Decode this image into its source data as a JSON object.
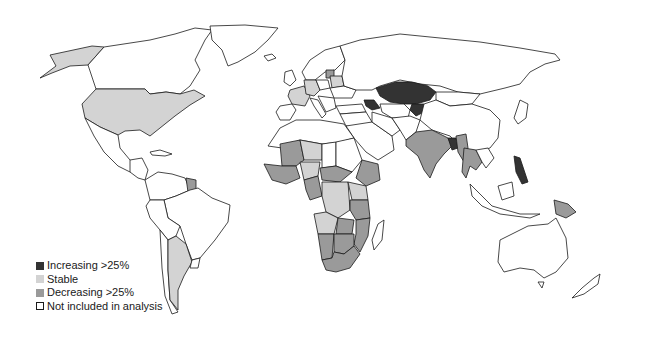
{
  "title": "",
  "categories": {
    "increasing": {
      "label": "Increasing >25%",
      "color": "#333333"
    },
    "stable": {
      "label": "Stable",
      "color": "#d3d3d3"
    },
    "decreasing": {
      "label": "Decreasing >25%",
      "color": "#9a9a9a"
    },
    "not_included": {
      "label": "Not included in analysis",
      "color": "#ffffff"
    }
  },
  "legend": [
    {
      "key": "increasing",
      "label": "Increasing >25%",
      "color": "#333333"
    },
    {
      "key": "stable",
      "label": "Stable",
      "color": "#d3d3d3"
    },
    {
      "key": "decreasing",
      "label": "Decreasing >25%",
      "color": "#9a9a9a"
    },
    {
      "key": "not_included",
      "label": "Not included in analysis",
      "color": "#ffffff"
    }
  ],
  "regions": [
    {
      "name": "Alaska",
      "category": "stable"
    },
    {
      "name": "Canada",
      "category": "not_included"
    },
    {
      "name": "Greenland",
      "category": "not_included"
    },
    {
      "name": "United States",
      "category": "stable"
    },
    {
      "name": "Mexico",
      "category": "not_included"
    },
    {
      "name": "Central America",
      "category": "not_included"
    },
    {
      "name": "Cuba",
      "category": "not_included"
    },
    {
      "name": "Venezuela",
      "category": "not_included"
    },
    {
      "name": "Colombia",
      "category": "not_included"
    },
    {
      "name": "Guyana",
      "category": "decreasing"
    },
    {
      "name": "Brazil",
      "category": "not_included"
    },
    {
      "name": "Peru",
      "category": "not_included"
    },
    {
      "name": "Bolivia",
      "category": "not_included"
    },
    {
      "name": "Chile",
      "category": "not_included"
    },
    {
      "name": "Argentina",
      "category": "stable"
    },
    {
      "name": "Uruguay",
      "category": "not_included"
    },
    {
      "name": "Iceland",
      "category": "not_included"
    },
    {
      "name": "United Kingdom",
      "category": "not_included"
    },
    {
      "name": "Scandinavia",
      "category": "not_included"
    },
    {
      "name": "France",
      "category": "stable"
    },
    {
      "name": "Germany",
      "category": "stable"
    },
    {
      "name": "Iberia",
      "category": "not_included"
    },
    {
      "name": "Italy",
      "category": "not_included"
    },
    {
      "name": "Poland",
      "category": "not_included"
    },
    {
      "name": "Belarus",
      "category": "stable"
    },
    {
      "name": "Baltics",
      "category": "decreasing"
    },
    {
      "name": "Ukraine",
      "category": "not_included"
    },
    {
      "name": "Balkans",
      "category": "not_included"
    },
    {
      "name": "Turkey",
      "category": "not_included"
    },
    {
      "name": "Russia",
      "category": "not_included"
    },
    {
      "name": "Kazakhstan",
      "category": "increasing"
    },
    {
      "name": "Caucasus",
      "category": "increasing"
    },
    {
      "name": "Kyrgyzstan",
      "category": "increasing"
    },
    {
      "name": "Central Asia",
      "category": "not_included"
    },
    {
      "name": "Mongolia",
      "category": "not_included"
    },
    {
      "name": "China",
      "category": "not_included"
    },
    {
      "name": "Japan",
      "category": "not_included"
    },
    {
      "name": "Middle East",
      "category": "not_included"
    },
    {
      "name": "Saudi Arabia",
      "category": "not_included"
    },
    {
      "name": "Iran",
      "category": "not_included"
    },
    {
      "name": "Afghanistan/Pakistan",
      "category": "not_included"
    },
    {
      "name": "India",
      "category": "decreasing"
    },
    {
      "name": "Bangladesh",
      "category": "increasing"
    },
    {
      "name": "Myanmar",
      "category": "decreasing"
    },
    {
      "name": "Thailand/Cambodia",
      "category": "decreasing"
    },
    {
      "name": "Vietnam",
      "category": "not_included"
    },
    {
      "name": "Philippines",
      "category": "increasing"
    },
    {
      "name": "Malaysia/Borneo",
      "category": "not_included"
    },
    {
      "name": "Indonesia",
      "category": "not_included"
    },
    {
      "name": "Papua New Guinea",
      "category": "decreasing"
    },
    {
      "name": "Australia",
      "category": "not_included"
    },
    {
      "name": "New Zealand",
      "category": "not_included"
    },
    {
      "name": "North Africa",
      "category": "not_included"
    },
    {
      "name": "Mali",
      "category": "decreasing"
    },
    {
      "name": "Niger",
      "category": "stable"
    },
    {
      "name": "West Africa",
      "category": "decreasing"
    },
    {
      "name": "Nigeria",
      "category": "stable"
    },
    {
      "name": "Chad",
      "category": "not_included"
    },
    {
      "name": "Sudan",
      "category": "not_included"
    },
    {
      "name": "Ethiopia",
      "category": "decreasing"
    },
    {
      "name": "Central African Republic",
      "category": "decreasing"
    },
    {
      "name": "Cameroon/Gabon",
      "category": "decreasing"
    },
    {
      "name": "DR Congo",
      "category": "stable"
    },
    {
      "name": "Kenya/Uganda",
      "category": "stable"
    },
    {
      "name": "Tanzania",
      "category": "decreasing"
    },
    {
      "name": "Angola",
      "category": "stable"
    },
    {
      "name": "Zambia",
      "category": "decreasing"
    },
    {
      "name": "Mozambique/Malawi",
      "category": "decreasing"
    },
    {
      "name": "Namibia",
      "category": "decreasing"
    },
    {
      "name": "Botswana/Zimbabwe",
      "category": "decreasing"
    },
    {
      "name": "South Africa",
      "category": "decreasing"
    },
    {
      "name": "Madagascar",
      "category": "not_included"
    }
  ]
}
